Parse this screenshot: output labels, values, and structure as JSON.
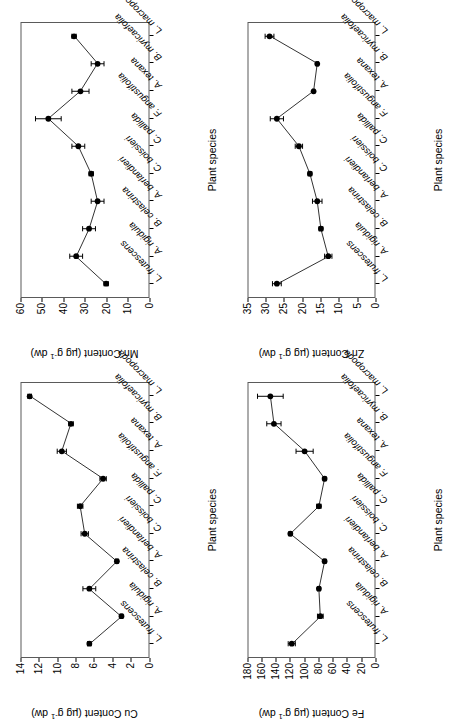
{
  "figure": {
    "xlabel": "Plant species",
    "species": [
      "L. frutescens",
      "A. rigidula",
      "B. celastrina",
      "A. berlandieri",
      "C. boissieri",
      "C. pallida",
      "F. angustifolia",
      "A. texana",
      "B. myricaefolia",
      "L. macropoda"
    ]
  },
  "chart_data": [
    {
      "id": "cu",
      "type": "line",
      "title": "",
      "xlabel": "Plant species",
      "ylabel": "Cu Content (µg g⁻¹ dw)",
      "ylabel_main": "Cu Content (µg g",
      "ylabel_sup": "-1",
      "ylabel_tail": " dw)",
      "categories": [
        "L. frutescens",
        "A. rigidula",
        "B. celastrina",
        "A. berlandieri",
        "C. boissieri",
        "C. pallida",
        "F. angustifolia",
        "A. texana",
        "B. myricaefolia",
        "L. macropoda"
      ],
      "values": [
        6.5,
        3.0,
        6.5,
        3.5,
        7.0,
        7.5,
        5.0,
        9.5,
        8.5,
        13.0
      ],
      "errors": [
        0.2,
        0.15,
        0.7,
        0.15,
        0.4,
        0.3,
        0.35,
        0.5,
        0.25,
        0.2
      ],
      "ylim": [
        0,
        14
      ],
      "yticks": [
        0,
        2,
        4,
        6,
        8,
        10,
        12,
        14
      ],
      "grid": false,
      "legend": "none",
      "panel_position": "bottom-left"
    },
    {
      "id": "fe",
      "type": "line",
      "title": "",
      "xlabel": "Plant species",
      "ylabel": "Fe Content (µg g⁻¹ dw)",
      "ylabel_main": "Fe Content (µg g",
      "ylabel_sup": "-1",
      "ylabel_tail": " dw)",
      "categories": [
        "L. frutescens",
        "A. rigidula",
        "B. celastrina",
        "A. berlandieri",
        "C. boissieri",
        "C. pallida",
        "F. angustifolia",
        "A. texana",
        "B. myricaefolia",
        "L. macropoda"
      ],
      "values": [
        118,
        78,
        80,
        72,
        120,
        80,
        72,
        100,
        143,
        148
      ],
      "errors": [
        5,
        4,
        2,
        2,
        2,
        3,
        2,
        12,
        10,
        18
      ],
      "ylim": [
        0,
        180
      ],
      "yticks": [
        0,
        20,
        40,
        60,
        80,
        100,
        120,
        140,
        160,
        180
      ],
      "grid": false,
      "legend": "none",
      "panel_position": "top-left"
    },
    {
      "id": "mn",
      "type": "line",
      "title": "",
      "xlabel": "Plant species",
      "ylabel": "Mn Content (µg g⁻¹ dw)",
      "ylabel_main": "Mn Content (µg g",
      "ylabel_sup": "-1",
      "ylabel_tail": " dw)",
      "categories": [
        "L. frutescens",
        "A. rigidula",
        "B. celastrina",
        "A. berlandieri",
        "C. boissieri",
        "C. pallida",
        "F. angustifolia",
        "A. texana",
        "B. myricaefolia",
        "L. macropoda"
      ],
      "values": [
        20,
        34,
        28,
        24,
        27,
        33,
        47,
        32,
        24,
        35
      ],
      "errors": [
        1,
        3,
        3,
        3,
        1,
        3,
        6,
        4,
        3,
        1
      ],
      "ylim": [
        0,
        60
      ],
      "yticks": [
        0,
        10,
        20,
        30,
        40,
        50,
        60
      ],
      "grid": false,
      "legend": "none",
      "panel_position": "bottom-right"
    },
    {
      "id": "zn",
      "type": "line",
      "title": "",
      "xlabel": "Plant species",
      "ylabel": "Zn Content (µg g⁻¹ dw)",
      "ylabel_main": "Zn Content (µg g",
      "ylabel_sup": "-1",
      "ylabel_tail": " dw)",
      "categories": [
        "L. frutescens",
        "A. rigidula",
        "B. celastrina",
        "A. berlandieri",
        "C. boissieri",
        "C. pallida",
        "F. angustifolia",
        "A. texana",
        "B. myricaefolia",
        "L. macropoda"
      ],
      "values": [
        27,
        13,
        15,
        16,
        18,
        21,
        27,
        17,
        16,
        29
      ],
      "errors": [
        1.2,
        1.0,
        0.5,
        1.3,
        0.5,
        1.0,
        1.8,
        0.3,
        0.3,
        1.2
      ],
      "ylim": [
        0,
        35
      ],
      "yticks": [
        0,
        5,
        10,
        15,
        20,
        25,
        30,
        35
      ],
      "grid": false,
      "legend": "none",
      "panel_position": "top-right"
    }
  ]
}
